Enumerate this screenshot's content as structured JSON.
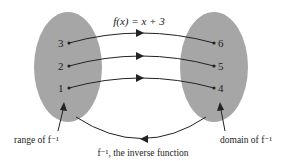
{
  "diagram": {
    "function_label": "f(x) = x + 3",
    "inverse_label": "f⁻¹, the inverse function",
    "range_label": "range of f⁻¹",
    "domain_label": "domain of f⁻¹",
    "left_set": [
      "3",
      "2",
      "1"
    ],
    "right_set": [
      "6",
      "5",
      "4"
    ],
    "colors": {
      "ellipse": "#a6a6a6",
      "ink": "#222222",
      "background": "#ffffff"
    }
  }
}
